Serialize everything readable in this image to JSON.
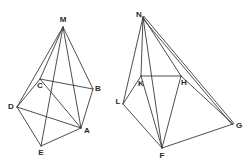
{
  "figures": [
    {
      "name": "left-polyhedron",
      "vertices": {
        "M": {
          "x": 63,
          "y": 27,
          "label": "M",
          "lx": 63,
          "ly": 20
        },
        "C": {
          "x": 40,
          "y": 79,
          "label": "C",
          "lx": 40,
          "ly": 86
        },
        "B": {
          "x": 93,
          "y": 89,
          "label": "B",
          "lx": 98,
          "ly": 89
        },
        "D": {
          "x": 17,
          "y": 107,
          "label": "D",
          "lx": 11,
          "ly": 107
        },
        "A": {
          "x": 81,
          "y": 128,
          "label": "A",
          "lx": 87,
          "ly": 131
        },
        "E": {
          "x": 41,
          "y": 146,
          "label": "E",
          "lx": 41,
          "ly": 153
        }
      },
      "edges": [
        [
          "M",
          "D"
        ],
        [
          "M",
          "C"
        ],
        [
          "M",
          "E"
        ],
        [
          "M",
          "A"
        ],
        [
          "M",
          "B"
        ],
        [
          "C",
          "B"
        ],
        [
          "D",
          "C"
        ],
        [
          "D",
          "A"
        ],
        [
          "D",
          "E"
        ],
        [
          "E",
          "A"
        ],
        [
          "C",
          "A"
        ],
        [
          "B",
          "A"
        ]
      ]
    },
    {
      "name": "right-polyhedron",
      "vertices": {
        "N": {
          "x": 143,
          "y": 17,
          "label": "N",
          "lx": 139,
          "ly": 15
        },
        "K": {
          "x": 141,
          "y": 76,
          "label": "K",
          "lx": 141,
          "ly": 84
        },
        "H": {
          "x": 181,
          "y": 76,
          "label": "H",
          "lx": 184,
          "ly": 83
        },
        "L": {
          "x": 123,
          "y": 104,
          "label": "L",
          "lx": 118,
          "ly": 102
        },
        "G": {
          "x": 233,
          "y": 124,
          "label": "G",
          "lx": 239,
          "ly": 126
        },
        "F": {
          "x": 162,
          "y": 148,
          "label": "F",
          "lx": 162,
          "ly": 156
        }
      },
      "edges": [
        [
          "N",
          "L"
        ],
        [
          "N",
          "K"
        ],
        [
          "N",
          "F"
        ],
        [
          "N",
          "H"
        ],
        [
          "N",
          "G"
        ],
        [
          "K",
          "H"
        ],
        [
          "L",
          "K"
        ],
        [
          "L",
          "F"
        ],
        [
          "K",
          "F"
        ],
        [
          "H",
          "F"
        ],
        [
          "F",
          "G"
        ],
        [
          "H",
          "G"
        ]
      ],
      "double_edges": [
        [
          "N",
          "G"
        ]
      ]
    }
  ],
  "labels": {
    "M": "M",
    "C": "C",
    "B": "B",
    "D": "D",
    "A": "A",
    "E": "E",
    "N": "N",
    "K": "K",
    "H": "H",
    "L": "L",
    "G": "G",
    "F": "F"
  },
  "colors": {
    "line": "#3a3a3a",
    "text": "#2a2a2a",
    "background": "#ffffff"
  }
}
